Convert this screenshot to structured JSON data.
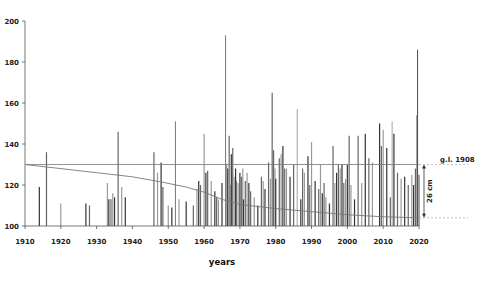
{
  "chart_data": {
    "type": "bar",
    "title": "",
    "xlabel": "years",
    "ylabel": "",
    "xlim": [
      1910,
      2020
    ],
    "ylim": [
      100,
      200
    ],
    "x_ticks": [
      1910,
      1920,
      1930,
      1940,
      1950,
      1960,
      1970,
      1980,
      1990,
      2000,
      2010,
      2020
    ],
    "y_ticks": [
      100,
      120,
      140,
      160,
      180,
      200
    ],
    "grid": false,
    "reference_line": {
      "label": "g.l. 1908",
      "value": 130
    },
    "annotation": {
      "label": "26 cm",
      "from": 104,
      "to": 130
    },
    "trend_line": {
      "x": [
        1910,
        1920,
        1930,
        1940,
        1948,
        1955,
        1960,
        1965,
        1970,
        1980,
        1990,
        2000,
        2010,
        2020
      ],
      "y": [
        130,
        128,
        126,
        124,
        121.5,
        119,
        116.5,
        113,
        110.5,
        108.5,
        107,
        105.5,
        104.5,
        104
      ]
    },
    "series": [
      {
        "name": "peaks",
        "x": [
          1914,
          1916,
          1920,
          1927,
          1928,
          1933,
          1933.4,
          1934,
          1934.5,
          1935,
          1936,
          1937,
          1938,
          1946,
          1947,
          1948,
          1948.5,
          1950,
          1951,
          1952,
          1953,
          1955,
          1957,
          1958,
          1958.5,
          1959,
          1960,
          1960.5,
          1961,
          1962,
          1963,
          1963.5,
          1964,
          1965,
          1966,
          1966.3,
          1966.6,
          1967,
          1967.3,
          1967.6,
          1968,
          1968.4,
          1968.8,
          1969,
          1969.5,
          1970,
          1970.4,
          1970.8,
          1971,
          1971.5,
          1972,
          1972.5,
          1973,
          1974,
          1975,
          1976,
          1976.5,
          1977,
          1978,
          1978.5,
          1979,
          1979.4,
          1979.8,
          1980,
          1981,
          1981.5,
          1982,
          1982.5,
          1983,
          1984,
          1985,
          1986,
          1987,
          1987.5,
          1988,
          1989,
          1989.5,
          1990,
          1991,
          1992,
          1992.5,
          1993,
          1993.5,
          1994,
          1995,
          1996,
          1996.5,
          1997,
          1997.5,
          1998,
          1998.5,
          1999,
          1999.5,
          2000,
          2000.5,
          2001,
          2002,
          2003,
          2004,
          2005,
          2006,
          2007,
          2009,
          2009.5,
          2010,
          2011,
          2012,
          2012.5,
          2013,
          2014,
          2015,
          2016,
          2017,
          2018,
          2018.5,
          2019,
          2019.3,
          2019.6,
          2020
        ],
        "values": [
          119,
          136,
          111,
          111,
          110,
          121,
          113,
          113,
          116,
          114,
          146,
          119,
          114,
          136,
          126,
          131,
          119,
          110,
          109,
          151,
          113,
          112,
          110,
          118,
          122,
          120,
          145,
          126,
          127,
          122,
          117,
          114,
          113,
          121,
          193,
          130,
          128,
          144,
          120,
          135,
          138,
          124,
          128,
          122,
          121,
          126,
          124,
          128,
          113,
          122,
          126,
          121,
          117,
          114,
          110,
          124,
          122,
          118,
          131,
          123,
          165,
          137,
          128,
          123,
          133,
          135,
          139,
          128,
          128,
          124,
          130,
          157,
          113,
          128,
          126,
          134,
          120,
          141,
          122,
          118,
          130,
          116,
          121,
          114,
          111,
          139,
          121,
          126,
          130,
          128,
          130,
          121,
          123,
          130,
          144,
          120,
          113,
          144,
          121,
          145,
          133,
          131,
          150,
          139,
          147,
          138,
          114,
          151,
          145,
          126,
          123,
          124,
          120,
          125,
          120,
          128,
          154,
          186,
          125
        ]
      }
    ]
  }
}
